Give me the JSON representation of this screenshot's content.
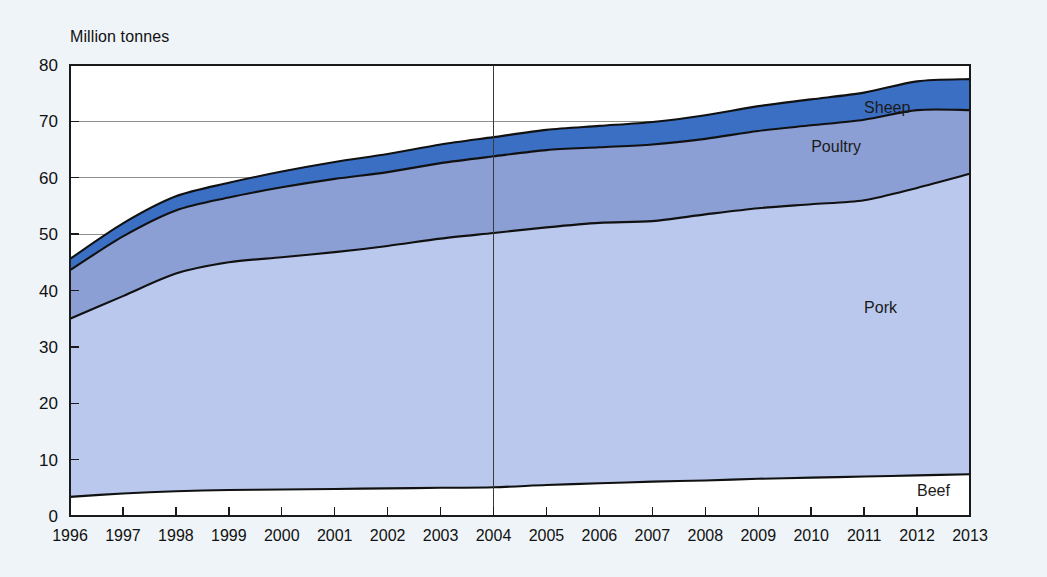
{
  "chart_data": {
    "type": "area",
    "stacked": true,
    "title": "",
    "subtitle": "",
    "ylabel": "Million tonnes",
    "xlabel": "",
    "ylim": [
      0,
      80
    ],
    "ytick_step": 10,
    "yticks": [
      0,
      10,
      20,
      30,
      40,
      50,
      60,
      70,
      80
    ],
    "grid": "horizontal",
    "gridline_values": [
      50,
      60,
      70
    ],
    "legend_position": "inline-right",
    "categories": [
      1996,
      1997,
      1998,
      1999,
      2000,
      2001,
      2002,
      2003,
      2004,
      2005,
      2006,
      2007,
      2008,
      2009,
      2010,
      2011,
      2012,
      2013
    ],
    "x": [
      "1996",
      "1997",
      "1998",
      "1999",
      "2000",
      "2001",
      "2002",
      "2003",
      "2004",
      "2005",
      "2006",
      "2007",
      "2008",
      "2009",
      "2010",
      "2011",
      "2012",
      "2013"
    ],
    "series": [
      {
        "name": "Beef",
        "color": "#ffffff",
        "label": "Beef",
        "values": [
          3.4,
          4.0,
          4.4,
          4.6,
          4.7,
          4.8,
          4.9,
          5.0,
          5.1,
          5.5,
          5.8,
          6.1,
          6.3,
          6.6,
          6.8,
          7.0,
          7.2,
          7.4
        ]
      },
      {
        "name": "Pork",
        "color": "#b9c8ec",
        "label": "Pork",
        "values": [
          31.6,
          35.0,
          38.6,
          40.4,
          41.2,
          42.0,
          43.0,
          44.2,
          45.1,
          45.7,
          46.2,
          46.2,
          47.2,
          48.0,
          48.5,
          49.0,
          51.0,
          53.3
        ]
      },
      {
        "name": "Poultry",
        "color": "#8c9fd4",
        "label": "Poultry",
        "values": [
          8.6,
          10.6,
          11.2,
          11.5,
          12.4,
          13.0,
          13.1,
          13.4,
          13.6,
          13.7,
          13.4,
          13.6,
          13.4,
          13.7,
          14.0,
          14.3,
          13.8,
          11.3
        ]
      },
      {
        "name": "Sheep",
        "color": "#3b6fc4",
        "label": "Sheep",
        "values": [
          2.0,
          2.3,
          2.5,
          2.6,
          2.8,
          3.0,
          3.2,
          3.3,
          3.4,
          3.6,
          3.8,
          4.0,
          4.2,
          4.4,
          4.6,
          4.8,
          5.1,
          5.5
        ]
      }
    ],
    "cumulative_tops": {
      "Beef": [
        3.4,
        4.0,
        4.4,
        4.6,
        4.7,
        4.8,
        4.9,
        5.0,
        5.1,
        5.5,
        5.8,
        6.1,
        6.3,
        6.6,
        6.8,
        7.0,
        7.2,
        7.4
      ],
      "Pork": [
        35.0,
        39.0,
        43.0,
        45.0,
        45.9,
        46.8,
        47.9,
        49.2,
        50.2,
        51.2,
        52.0,
        52.3,
        53.5,
        54.6,
        55.3,
        56.0,
        58.2,
        60.7
      ],
      "Poultry": [
        43.6,
        49.6,
        54.2,
        56.5,
        58.3,
        59.8,
        61.0,
        62.6,
        63.8,
        64.9,
        65.4,
        65.9,
        66.9,
        68.3,
        69.3,
        70.3,
        72.0,
        72.0
      ],
      "Sheep": [
        45.6,
        51.9,
        56.7,
        59.1,
        61.1,
        62.8,
        64.2,
        65.9,
        67.2,
        68.5,
        69.2,
        69.9,
        71.1,
        72.7,
        73.9,
        75.1,
        77.1,
        77.5
      ]
    },
    "annotations": [
      {
        "name": "forecast-divider",
        "type": "vline",
        "x": "2004",
        "label": ""
      }
    ],
    "series_label_positions": [
      {
        "name": "Sheep",
        "x": "2011",
        "y": 71.5
      },
      {
        "name": "Poultry",
        "x": "2010",
        "y": 64.5
      },
      {
        "name": "Pork",
        "x": "2011",
        "y": 36.0
      },
      {
        "name": "Beef",
        "x": "2012",
        "y": 3.6
      }
    ]
  },
  "colors": {
    "background": "#eef4f8",
    "plot_background": "#ffffff",
    "axis": "#1a1a1a",
    "gridline": "#8f8f8f",
    "divider": "#3a3a3a",
    "beef": "#ffffff",
    "pork": "#b9c8ec",
    "poultry": "#8c9fd4",
    "sheep": "#3b6fc4"
  }
}
